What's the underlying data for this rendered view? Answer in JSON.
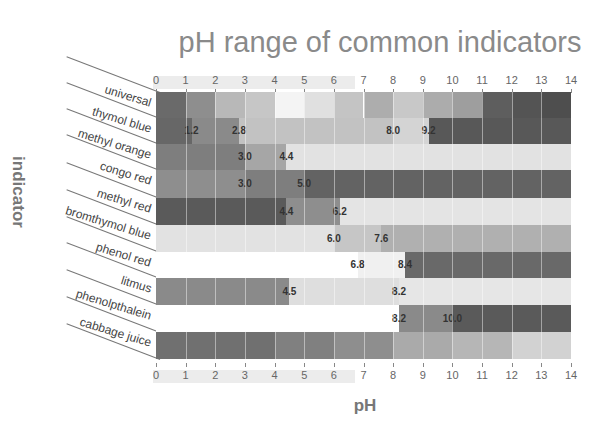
{
  "chart_data": {
    "type": "heatmap",
    "title": "pH range of common indicators",
    "xlabel": "pH",
    "ylabel": "indicator",
    "xlim": [
      0,
      14
    ],
    "x_ticks": [
      "0",
      "1",
      "2",
      "3",
      "4",
      "5",
      "6",
      "7",
      "8",
      "9",
      "10",
      "11",
      "12",
      "13",
      "14"
    ],
    "grid": true,
    "indicators": [
      {
        "name": "universal",
        "transitions": [],
        "segments": [
          {
            "from": 0,
            "to": 1,
            "color": "#6a6a6a"
          },
          {
            "from": 1,
            "to": 2,
            "color": "#8e8e8e"
          },
          {
            "from": 2,
            "to": 3,
            "color": "#b8b8b8"
          },
          {
            "from": 3,
            "to": 4,
            "color": "#c6c6c6"
          },
          {
            "from": 4,
            "to": 5,
            "color": "#f4f4f4"
          },
          {
            "from": 5,
            "to": 6,
            "color": "#e0e0e0"
          },
          {
            "from": 6,
            "to": 7,
            "color": "#c4c4c4"
          },
          {
            "from": 7,
            "to": 8,
            "color": "#adadad"
          },
          {
            "from": 8,
            "to": 9,
            "color": "#c8c8c8"
          },
          {
            "from": 9,
            "to": 10,
            "color": "#acacac"
          },
          {
            "from": 10,
            "to": 11,
            "color": "#9e9e9e"
          },
          {
            "from": 11,
            "to": 12,
            "color": "#5e5e5e"
          },
          {
            "from": 12,
            "to": 13,
            "color": "#545454"
          },
          {
            "from": 13,
            "to": 14,
            "color": "#4e4e4e"
          }
        ]
      },
      {
        "name": "thymol blue",
        "transitions": [
          1.2,
          2.8,
          8.0,
          9.2
        ],
        "labels": [
          "1.2",
          "2.8",
          "8.0",
          "9.2"
        ],
        "segments": [
          {
            "from": 0,
            "to": 1.2,
            "color": "#676767"
          },
          {
            "from": 1.2,
            "to": 2.8,
            "color": "#8a8a8a"
          },
          {
            "from": 2.8,
            "to": 8.0,
            "color": "#c2c2c2"
          },
          {
            "from": 8.0,
            "to": 9.2,
            "color": "#d4d4d4"
          },
          {
            "from": 9.2,
            "to": 14,
            "color": "#585858"
          }
        ]
      },
      {
        "name": "methyl orange",
        "transitions": [
          3.0,
          4.4
        ],
        "labels": [
          "3.0",
          "4.4"
        ],
        "segments": [
          {
            "from": 0,
            "to": 3.0,
            "color": "#7e7e7e"
          },
          {
            "from": 3.0,
            "to": 4.4,
            "color": "#a6a6a6"
          },
          {
            "from": 4.4,
            "to": 14,
            "color": "#e2e2e2"
          }
        ]
      },
      {
        "name": "congo red",
        "transitions": [
          3.0,
          5.0
        ],
        "labels": [
          "3.0",
          "5.0"
        ],
        "segments": [
          {
            "from": 0,
            "to": 3.0,
            "color": "#8e8e8e"
          },
          {
            "from": 3.0,
            "to": 5.0,
            "color": "#7e7e7e"
          },
          {
            "from": 5.0,
            "to": 14,
            "color": "#636363"
          }
        ]
      },
      {
        "name": "methyl red",
        "transitions": [
          4.4,
          6.2
        ],
        "labels": [
          "4.4",
          "6.2"
        ],
        "segments": [
          {
            "from": 0,
            "to": 4.4,
            "color": "#5a5a5a"
          },
          {
            "from": 4.4,
            "to": 6.2,
            "color": "#8e8e8e"
          },
          {
            "from": 6.2,
            "to": 14,
            "color": "#e4e4e4"
          }
        ]
      },
      {
        "name": "bromthymol blue",
        "transitions": [
          6.0,
          7.6
        ],
        "labels": [
          "6.0",
          "7.6"
        ],
        "segments": [
          {
            "from": 0,
            "to": 6.0,
            "color": "#e2e2e2"
          },
          {
            "from": 6.0,
            "to": 7.6,
            "color": "#c6c6c6"
          },
          {
            "from": 7.6,
            "to": 14,
            "color": "#b0b0b0"
          }
        ]
      },
      {
        "name": "phenol red",
        "transitions": [
          6.8,
          8.4
        ],
        "labels": [
          "6.8",
          "8.4"
        ],
        "segments": [
          {
            "from": 0,
            "to": 6.8,
            "color": "#ffffff"
          },
          {
            "from": 6.8,
            "to": 8.4,
            "color": "#f0f0f0"
          },
          {
            "from": 8.4,
            "to": 14,
            "color": "#696969"
          }
        ]
      },
      {
        "name": "litmus",
        "transitions": [
          4.5,
          8.2
        ],
        "labels": [
          "4.5",
          "8.2"
        ],
        "segments": [
          {
            "from": 0,
            "to": 4.5,
            "color": "#8a8a8a"
          },
          {
            "from": 4.5,
            "to": 8.2,
            "color": "#dedede"
          },
          {
            "from": 8.2,
            "to": 14,
            "color": "#e6e6e6"
          }
        ]
      },
      {
        "name": "phenolpthalein",
        "transitions": [
          8.2,
          10.0
        ],
        "labels": [
          "8.2",
          "10.0"
        ],
        "segments": [
          {
            "from": 0,
            "to": 8.2,
            "color": "#ffffff"
          },
          {
            "from": 8.2,
            "to": 10.0,
            "color": "#8a8a8a"
          },
          {
            "from": 10.0,
            "to": 14,
            "color": "#5a5a5a"
          }
        ]
      },
      {
        "name": "cabbage juice",
        "transitions": [],
        "segments": [
          {
            "from": 0,
            "to": 4,
            "color": "#707070"
          },
          {
            "from": 4,
            "to": 6,
            "color": "#808080"
          },
          {
            "from": 6,
            "to": 8,
            "color": "#8e8e8e"
          },
          {
            "from": 8,
            "to": 10,
            "color": "#aaaaaa"
          },
          {
            "from": 10,
            "to": 12,
            "color": "#b6b6b6"
          },
          {
            "from": 12,
            "to": 14,
            "color": "#d2d2d2"
          }
        ]
      }
    ]
  }
}
